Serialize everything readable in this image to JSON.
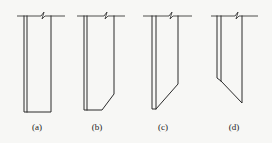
{
  "diagram": {
    "type": "cross-section figures of wall / pile shapes",
    "figures": [
      {
        "id": "a",
        "label": "(a)",
        "shape": "rectangular with double left wall, flat bottom"
      },
      {
        "id": "b",
        "label": "(b)",
        "shape": "double left wall, bottom-right chamfered corner"
      },
      {
        "id": "c",
        "label": "(c)",
        "shape": "double left wall, long diagonal bottom rising to right"
      },
      {
        "id": "d",
        "label": "(d)",
        "shape": "double left wall, diagonal bottom descending to right"
      }
    ]
  },
  "colors": {
    "background": "#f7f7f5",
    "line": "#2a2a2a"
  }
}
